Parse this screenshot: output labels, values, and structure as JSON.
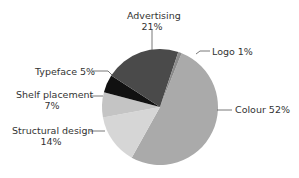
{
  "chart_data": {
    "type": "pie",
    "title": "",
    "slices": [
      {
        "label": "Colour",
        "value": 52,
        "display": "Colour 52%",
        "color": "#aaaaaa"
      },
      {
        "label": "Structural design",
        "value": 14,
        "display": "Structural design 14%",
        "color": "#d6d6d6"
      },
      {
        "label": "Shelf placement",
        "value": 7,
        "display": "Shelf placement 7%",
        "color": "#c4c4c4"
      },
      {
        "label": "Typeface",
        "value": 5,
        "display": "Typeface 5%",
        "color": "#111111"
      },
      {
        "label": "Advertising",
        "value": 21,
        "display": "Advertising 21%",
        "color": "#4a4a4a"
      },
      {
        "label": "Logo",
        "value": 1,
        "display": "Logo 1%",
        "color": "#8a8a8a"
      }
    ]
  },
  "labels": {
    "advertising_name": "Advertising",
    "advertising_pct": "21%",
    "logo": "Logo 1%",
    "typeface": "Typeface 5%",
    "shelf_name": "Shelf placement",
    "shelf_pct": "7%",
    "colour": "Colour 52%",
    "structural_name": "Structural design",
    "structural_pct": "14%"
  }
}
